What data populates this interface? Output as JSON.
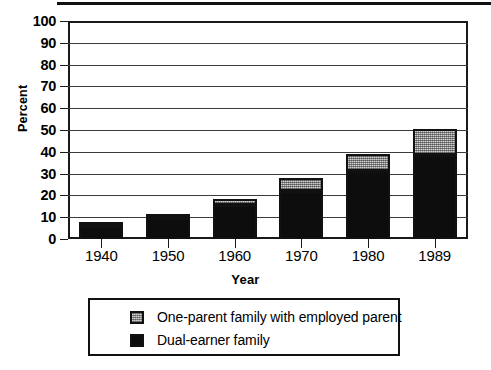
{
  "chart_data": {
    "type": "bar",
    "subtype": "stacked-bar",
    "title": "",
    "xlabel": "Year",
    "ylabel": "Percent",
    "categories": [
      "1940",
      "1950",
      "1960",
      "1970",
      "1980",
      "1989"
    ],
    "ylim": [
      0,
      100
    ],
    "yticks": [
      0,
      10,
      20,
      30,
      40,
      50,
      60,
      70,
      80,
      90,
      100
    ],
    "ytick_labels": [
      "0",
      "10",
      "20",
      "30",
      "40",
      "50",
      "60",
      "70",
      "80",
      "90",
      "100"
    ],
    "grid": true,
    "grid_axis": "y",
    "legend_position": "bottom",
    "series": [
      {
        "name": "Dual-earner family",
        "color": "#0d0d0d",
        "values": [
          6,
          9.5,
          15.5,
          22,
          31,
          38.5
        ]
      },
      {
        "name": "One-parent family with employed parent",
        "color": "#9a9a9a",
        "values": [
          1.5,
          1.5,
          3,
          6,
          8,
          12
        ]
      }
    ],
    "totals": [
      7.5,
      11,
      18.5,
      28,
      39,
      50.5
    ]
  },
  "legend": {
    "items": [
      {
        "label": "One-parent family with employed parent",
        "swatch": "gray-stippled"
      },
      {
        "label": "Dual-earner family",
        "swatch": "solid-black"
      }
    ]
  },
  "axes": {
    "y_title": "Percent",
    "x_title": "Year"
  }
}
